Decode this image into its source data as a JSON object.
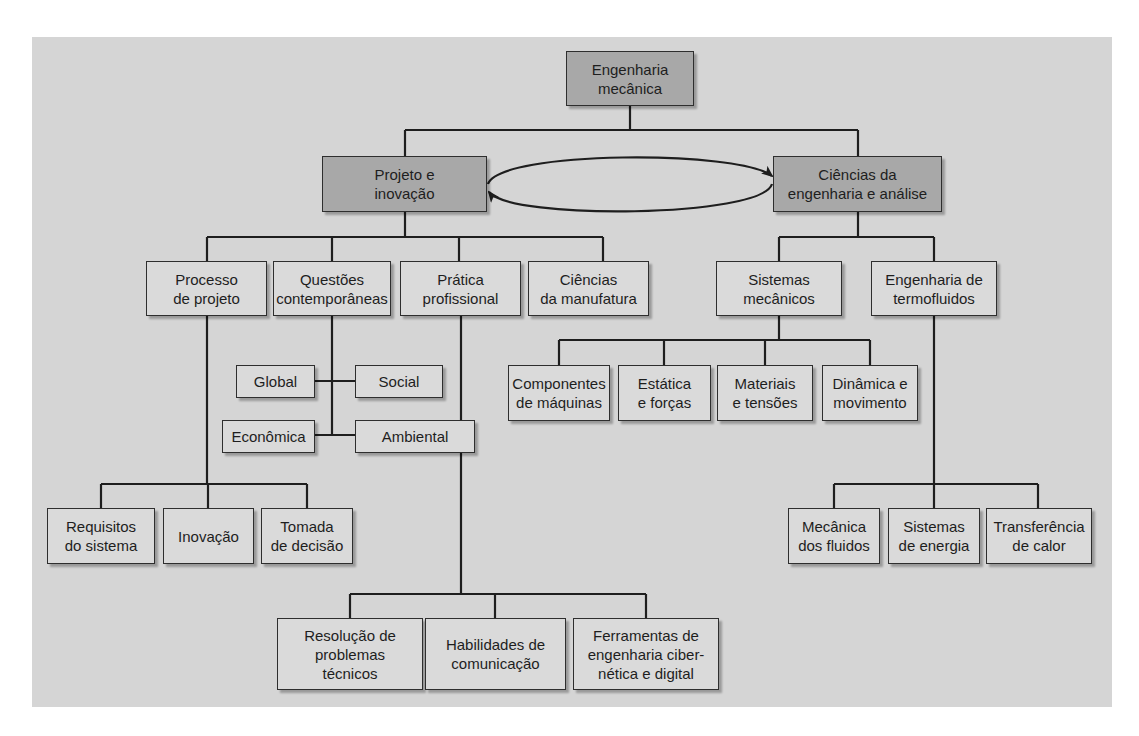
{
  "colors": {
    "panel_bg": "#d5d5d5",
    "node_light": "#dadada",
    "node_dark": "#a8a8a8",
    "line": "#1e1e1e"
  },
  "diagram": {
    "root": "Engenharia\nmecânica",
    "branches": {
      "design": "Projeto e\ninovação",
      "science": "Ciências da\nengenharia e análise"
    },
    "cycle_arrow": "bidirectional loop between Projeto e inovação and Ciências da engenharia e análise",
    "design_children": {
      "process": "Processo\nde projeto",
      "contemporary": "Questões\ncontemporâneas",
      "practice": "Prática\nprofissional",
      "manufacturing": "Ciências\nda manufatura"
    },
    "contemporary_children": {
      "global": "Global",
      "social": "Social",
      "economic": "Econômica",
      "environmental": "Ambiental"
    },
    "process_children": {
      "requirements": "Requisitos\ndo sistema",
      "innovation": "Inovação",
      "decision": "Tomada\nde decisão"
    },
    "practice_children": {
      "problem_solving": "Resolução de\nproblemas\ntécnicos",
      "communication": "Habilidades de\ncomunicação",
      "tools": "Ferramentas de\nengenharia ciber-\nnética e digital"
    },
    "science_children": {
      "mechanical_systems": "Sistemas\nmecânicos",
      "thermofluids": "Engenharia de\ntermofluidos"
    },
    "mechanical_children": {
      "components": "Componentes\nde máquinas",
      "statics": "Estática\ne forças",
      "materials": "Materiais\ne tensões",
      "dynamics": "Dinâmica e\nmovimento"
    },
    "thermo_children": {
      "fluids": "Mecânica\ndos fluidos",
      "energy": "Sistemas\nde energia",
      "heat": "Transferência\nde calor"
    }
  }
}
